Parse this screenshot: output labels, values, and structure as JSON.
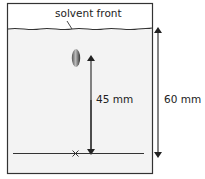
{
  "diagram": {
    "type": "paper chromatography (Rf measurement)",
    "labels": {
      "solvent_front": "solvent front",
      "spot_distance": "45 mm",
      "solvent_distance": "60 mm"
    },
    "colors": {
      "outline": "#333333",
      "paper_fill": "#f2f2f2",
      "spot_dark": "#444444",
      "spot_light": "#bbbbbb"
    },
    "measurements": {
      "spot_distance_mm": 45,
      "solvent_distance_mm": 60
    }
  }
}
